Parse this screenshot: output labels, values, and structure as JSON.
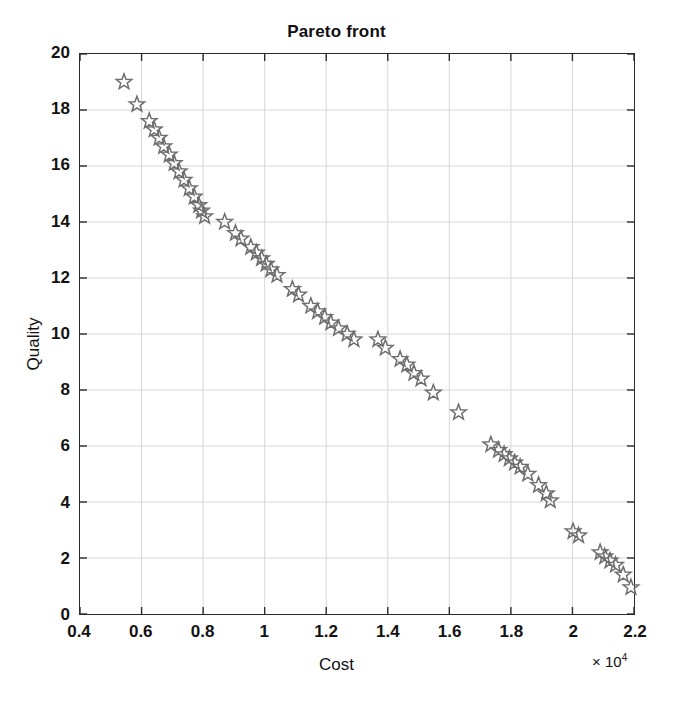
{
  "chart_data": {
    "type": "scatter",
    "title": "Pareto front",
    "xlabel": "Cost",
    "ylabel": "Quality",
    "x_exponent_label": "× 10",
    "x_exponent_power": "4",
    "x_scale_factor": 10000,
    "xlim": [
      0.4,
      2.2
    ],
    "ylim": [
      0,
      20
    ],
    "xticks": [
      "0.4",
      "0.6",
      "0.8",
      "1",
      "1.2",
      "1.4",
      "1.6",
      "1.8",
      "2",
      "2.2"
    ],
    "xtick_values": [
      0.4,
      0.6,
      0.8,
      1.0,
      1.2,
      1.4,
      1.6,
      1.8,
      2.0,
      2.2
    ],
    "yticks": [
      "0",
      "2",
      "4",
      "6",
      "8",
      "10",
      "12",
      "14",
      "16",
      "18",
      "20"
    ],
    "ytick_values": [
      0,
      2,
      4,
      6,
      8,
      10,
      12,
      14,
      16,
      18,
      20
    ],
    "grid": true,
    "legend": null,
    "marker": "star",
    "marker_color": "#6e6e6e",
    "marker_fill": "none",
    "series": [
      {
        "name": "Pareto front",
        "x": [
          0.543,
          0.585,
          0.625,
          0.641,
          0.657,
          0.672,
          0.69,
          0.706,
          0.722,
          0.738,
          0.755,
          0.771,
          0.786,
          0.795,
          0.805,
          0.87,
          0.905,
          0.923,
          0.955,
          0.973,
          0.99,
          1.005,
          1.02,
          1.04,
          1.09,
          1.11,
          1.15,
          1.172,
          1.195,
          1.215,
          1.24,
          1.268,
          1.29,
          1.368,
          1.392,
          1.44,
          1.462,
          1.485,
          1.508,
          1.548,
          1.63,
          1.735,
          1.76,
          1.778,
          1.795,
          1.812,
          1.83,
          1.855,
          1.89,
          1.915,
          1.928,
          2.002,
          2.02,
          2.09,
          2.105,
          2.122,
          2.14,
          2.165,
          2.19
        ],
        "y": [
          19.0,
          18.2,
          17.6,
          17.3,
          17.0,
          16.7,
          16.4,
          16.1,
          15.8,
          15.5,
          15.2,
          14.9,
          14.6,
          14.4,
          14.2,
          14.0,
          13.6,
          13.4,
          13.1,
          12.9,
          12.7,
          12.5,
          12.3,
          12.1,
          11.6,
          11.4,
          11.0,
          10.8,
          10.6,
          10.4,
          10.2,
          10.0,
          9.8,
          9.8,
          9.5,
          9.1,
          8.9,
          8.6,
          8.4,
          7.9,
          7.2,
          6.05,
          5.85,
          5.7,
          5.55,
          5.4,
          5.25,
          5.0,
          4.6,
          4.3,
          4.05,
          2.95,
          2.8,
          2.2,
          2.05,
          1.9,
          1.75,
          1.4,
          0.95
        ]
      }
    ]
  }
}
